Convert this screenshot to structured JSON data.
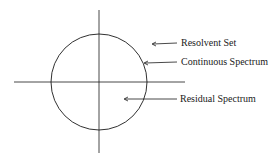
{
  "diagram": {
    "labels": {
      "resolvent": "Resolvent Set",
      "continuous": "Continuous Spectrum",
      "residual": "Residual Spectrum"
    },
    "colors": {
      "stroke": "#1a1a1a",
      "background": "#ffffff"
    }
  }
}
